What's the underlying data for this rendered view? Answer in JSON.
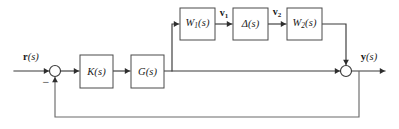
{
  "diagram": {
    "type": "control-system-block-diagram",
    "width": 399,
    "height": 129,
    "background_color": "#ffffff",
    "line_color": "#3a3a3a",
    "box_stroke_color": "#4a4a4a",
    "box_fill_color": "#ffffff"
  },
  "blocks": [
    {
      "id": "K",
      "name": "controller-block",
      "label_main": "K",
      "label_paren": "(s)",
      "subscript": "",
      "x": 80,
      "y": 55,
      "w": 33,
      "h": 33
    },
    {
      "id": "G",
      "name": "plant-block",
      "label_main": "G",
      "label_paren": "(s)",
      "subscript": "",
      "x": 131,
      "y": 55,
      "w": 33,
      "h": 33
    },
    {
      "id": "W1",
      "name": "weight-one-block",
      "label_main": "W",
      "label_paren": "(s)",
      "subscript": "1",
      "x": 180,
      "y": 8,
      "w": 35,
      "h": 32
    },
    {
      "id": "Delta",
      "name": "uncertainty-block",
      "label_main": "Δ",
      "label_paren": "(s)",
      "subscript": "",
      "x": 233,
      "y": 8,
      "w": 35,
      "h": 32
    },
    {
      "id": "W2",
      "name": "weight-two-block",
      "label_main": "W",
      "label_paren": "(s)",
      "subscript": "2",
      "x": 287,
      "y": 8,
      "w": 35,
      "h": 32
    }
  ],
  "junctions": [
    {
      "id": "sum-in",
      "name": "input-summing-junction",
      "cx": 55,
      "cy": 71,
      "r": 5.5,
      "sign": "−",
      "sign_x": 46,
      "sign_y": 82
    },
    {
      "id": "sum-out",
      "name": "output-summing-junction",
      "cx": 346,
      "cy": 71,
      "r": 5.5,
      "sign": "",
      "sign_x": 0,
      "sign_y": 0
    }
  ],
  "signals": [
    {
      "id": "r",
      "name": "reference-input-label",
      "bold_part": "r",
      "italic_part": "(s)",
      "x": 31,
      "y": 57
    },
    {
      "id": "y",
      "name": "output-signal-label",
      "bold_part": "y",
      "italic_part": "(s)",
      "x": 369,
      "y": 57
    },
    {
      "id": "v1",
      "name": "v1-signal-label",
      "bold_part": "v",
      "subscript": "1",
      "x": 224,
      "y": 14
    },
    {
      "id": "v2",
      "name": "v2-signal-label",
      "bold_part": "v",
      "subscript": "2",
      "x": 277,
      "y": 13
    }
  ],
  "wires": [
    {
      "name": "input-wire",
      "path": "M 14 71 L 49 71"
    },
    {
      "name": "sum-to-controller-wire",
      "path": "M 60.5 71 L 79 71"
    },
    {
      "name": "controller-to-plant-wire",
      "path": "M 113 71 L 130 71"
    },
    {
      "name": "plant-to-output-wire",
      "path": "M 164 71 L 345 71"
    },
    {
      "name": "branch-up-wire",
      "path": "M 172 71 L 172 24 L 179 24"
    },
    {
      "name": "w1-to-delta-wire",
      "path": "M 215 24 L 232 24"
    },
    {
      "name": "delta-to-w2-wire",
      "path": "M 268 24 L 286 24"
    },
    {
      "name": "w2-to-sum-wire",
      "path": "M 322 24 L 346 24 L 346 65"
    },
    {
      "name": "output-wire",
      "path": "M 352 71 L 385 71"
    },
    {
      "name": "feedback-wire",
      "path": "M 359 71 L 359 117 L 55 117 L 55 77"
    }
  ],
  "arrowheads": [
    {
      "name": "arrow-into-sum-in",
      "x": 49,
      "y": 71,
      "dir": "right"
    },
    {
      "name": "arrow-into-controller",
      "x": 79,
      "y": 71,
      "dir": "right"
    },
    {
      "name": "arrow-into-plant",
      "x": 130,
      "y": 71,
      "dir": "right"
    },
    {
      "name": "arrow-into-w1",
      "x": 179,
      "y": 24,
      "dir": "right"
    },
    {
      "name": "arrow-into-delta",
      "x": 232,
      "y": 24,
      "dir": "right"
    },
    {
      "name": "arrow-into-w2",
      "x": 286,
      "y": 24,
      "dir": "right"
    },
    {
      "name": "arrow-into-sum-out-top",
      "x": 346,
      "y": 65,
      "dir": "down"
    },
    {
      "name": "arrow-into-sum-out-left",
      "x": 340,
      "y": 71,
      "dir": "right"
    },
    {
      "name": "arrow-output-end",
      "x": 385,
      "y": 71,
      "dir": "right"
    },
    {
      "name": "arrow-feedback-up",
      "x": 55,
      "y": 77,
      "dir": "up"
    }
  ]
}
